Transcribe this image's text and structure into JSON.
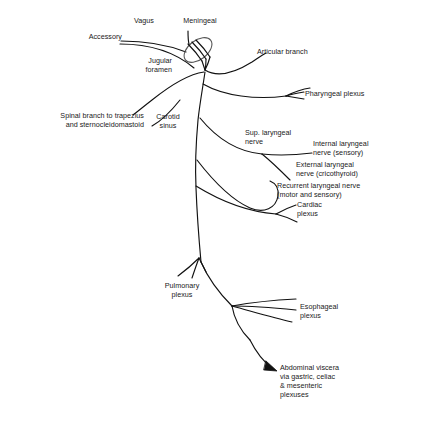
{
  "figure": {
    "line_color": "#111111",
    "text_color": "#1a1a1a",
    "background": "#ffffff"
  },
  "labels": {
    "accessory": "Accessory",
    "vagus": "Vagus",
    "meningeal": "Meningeal",
    "jugular_foramen_line1": "Jugular",
    "jugular_foramen_line2": "foramen",
    "articular_branch": "Articular branch",
    "pharyngeal_plexus": "Pharyngeal plexus",
    "spinal_branch_line1": "Spinal branch to trapezius",
    "spinal_branch_line2": "and sternocleidomastoid",
    "carotid_sinus_line1": "Carotid",
    "carotid_sinus_line2": "sinus",
    "sup_laryngeal_line1": "Sup. laryngeal",
    "sup_laryngeal_line2": "nerve",
    "internal_laryngeal_line1": "Internal laryngeal",
    "internal_laryngeal_line2": "nerve (sensory)",
    "external_laryngeal_line1": "External laryngeal",
    "external_laryngeal_line2": "nerve (cricothyroid)",
    "recurrent_laryngeal_line1": "Recurrent laryngeal nerve",
    "recurrent_laryngeal_line2": "(motor and sensory)",
    "cardiac_plexus_line1": "Cardiac",
    "cardiac_plexus_line2": "plexus",
    "pulmonary_plexus_line1": "Pulmonary",
    "pulmonary_plexus_line2": "plexus",
    "esophageal_plexus_line1": "Esophageal",
    "esophageal_plexus_line2": "plexus",
    "abdominal_line1": "Abdominal viscera",
    "abdominal_line2": "via gastric, celiac",
    "abdominal_line3": "& mesenteric",
    "abdominal_line4": "plexuses"
  }
}
